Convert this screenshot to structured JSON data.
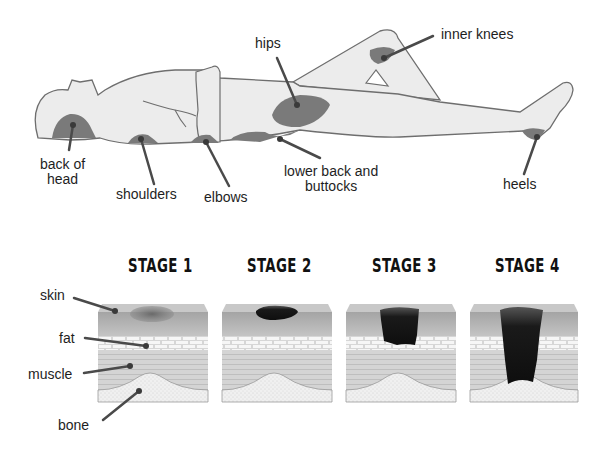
{
  "figure": {
    "body_labels": [
      {
        "id": "back-of-head",
        "text_line1": "back of",
        "text_line2": "head"
      },
      {
        "id": "shoulders",
        "text": "shoulders"
      },
      {
        "id": "elbows",
        "text": "elbows"
      },
      {
        "id": "hips",
        "text": "hips"
      },
      {
        "id": "inner-knees",
        "text": "inner knees"
      },
      {
        "id": "lower-back",
        "text_line1": "lower back and",
        "text_line2": "buttocks"
      },
      {
        "id": "heels",
        "text": "heels"
      }
    ],
    "stages": [
      "STAGE 1",
      "STAGE 2",
      "STAGE 3",
      "STAGE 4"
    ],
    "layer_labels": [
      "skin",
      "fat",
      "muscle",
      "bone"
    ],
    "colors": {
      "body_fill": "#ececec",
      "body_outline": "#6e6e6e",
      "pressure_area": "#7a7a7a",
      "leader_line": "#4a4a4a",
      "skin_top": "#a8a8a8",
      "skin_bottom": "#bdbdbd",
      "fat": "#f4f4f4",
      "muscle": "#d2d2d2",
      "bone": "#eeeeee",
      "wound": "#141414"
    }
  }
}
